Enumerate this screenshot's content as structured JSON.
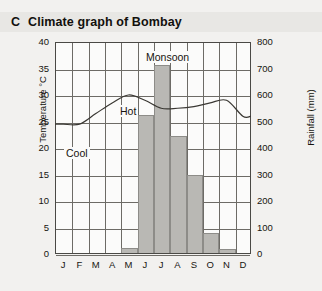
{
  "header": {
    "panel_letter": "C",
    "title": "Climate graph of Bombay"
  },
  "axes": {
    "left_title": "Temperature °C",
    "right_title": "Rainfall (mm)",
    "left_ticks": [
      "40",
      "35",
      "30",
      "25",
      "20",
      "15",
      "10",
      "5",
      "0"
    ],
    "right_ticks": [
      "800",
      "700",
      "600",
      "500",
      "400",
      "300",
      "200",
      "100",
      "0"
    ],
    "month_labels": [
      "J",
      "F",
      "M",
      "A",
      "M",
      "J",
      "J",
      "A",
      "S",
      "O",
      "N",
      "D"
    ]
  },
  "annotations": [
    {
      "name": "cool",
      "text": "Cool"
    },
    {
      "name": "hot",
      "text": "Hot"
    },
    {
      "name": "monsoon",
      "text": "Monsoon"
    }
  ],
  "colors": {
    "bar_fill": "#b9b8b4",
    "bar_stroke": "#8d8c88",
    "grid": "#6d6b66",
    "frame": "#4a4945",
    "curve": "#3a3833",
    "page_bg": "#f2f1ef",
    "title_bg": "#e8e7e4",
    "plot_bg": "#fbfbfa"
  },
  "chart_data": {
    "type": "bar",
    "title": "Climate graph of Bombay",
    "categories": [
      "J",
      "F",
      "M",
      "A",
      "M",
      "J",
      "J",
      "A",
      "S",
      "O",
      "N",
      "D"
    ],
    "series": [
      {
        "name": "Rainfall",
        "unit": "mm",
        "axis": "right",
        "type": "bar",
        "values": [
          0,
          0,
          0,
          0,
          20,
          520,
          709,
          440,
          295,
          75,
          15,
          0
        ]
      },
      {
        "name": "Temperature",
        "unit": "°C",
        "axis": "left",
        "type": "line",
        "values": [
          24.5,
          24.5,
          26.5,
          28.5,
          30.0,
          29.0,
          27.5,
          27.5,
          27.8,
          28.5,
          29.0,
          26.0
        ]
      }
    ],
    "xlabel": "",
    "ylabel": "Temperature °C",
    "y2label": "Rainfall (mm)",
    "ylim": [
      0,
      40
    ],
    "y2lim": [
      0,
      800
    ],
    "grid": true,
    "legend": "none"
  }
}
